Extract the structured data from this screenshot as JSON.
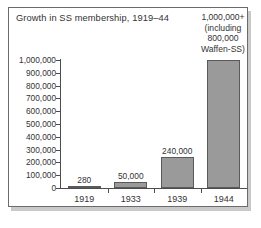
{
  "chart_data": {
    "type": "bar",
    "title": "Growth in SS membership, 1919–44",
    "xlabel": "",
    "ylabel": "",
    "categories": [
      "1919",
      "1933",
      "1939",
      "1944"
    ],
    "values": [
      280,
      50000,
      240000,
      1000000
    ],
    "value_labels": [
      "280",
      "50,000",
      "240,000",
      ""
    ],
    "ylim": [
      0,
      1000000
    ],
    "ytick_labels": [
      "1,000,000",
      "900,000",
      "800,000",
      "700,000",
      "600,000",
      "500,000",
      "400,000",
      "300,000",
      "200,000",
      "100,000",
      "0"
    ],
    "ytick_values": [
      1000000,
      900000,
      800000,
      700000,
      600000,
      500000,
      400000,
      300000,
      200000,
      100000,
      0
    ],
    "grid": false,
    "legend": false,
    "annotation": {
      "lines": [
        "1,000,000+",
        "(including",
        "800,000",
        "Waffen-SS)"
      ],
      "target_category": "1944"
    },
    "colors": {
      "bar_fill": "#9a9a9a",
      "bar_stroke": "#5a5a5a",
      "axis": "#4d4d4d",
      "text": "#333333",
      "frame": "#6b6b6b",
      "background": "#ffffff"
    }
  }
}
